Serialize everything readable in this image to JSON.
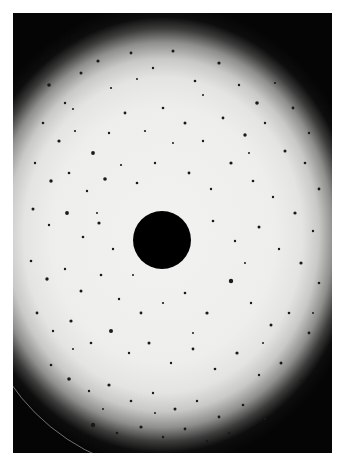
{
  "image": {
    "description": "Circular bright field of view with dark vignetted edges, scattered dark speckles, and an opaque dark disk at the center",
    "colors": {
      "background": "#ffffff",
      "field_center": "#f0f0ee",
      "vignette": "#050505",
      "speckle": "#1a1a1a",
      "center_disk": "#000000"
    },
    "center_disk": {
      "cx": 149,
      "cy": 227,
      "r": 29
    },
    "speckles": [
      [
        36,
        72,
        1.8
      ],
      [
        52,
        90,
        1.2
      ],
      [
        68,
        60,
        1.5
      ],
      [
        85,
        48,
        1.6
      ],
      [
        98,
        75,
        1.1
      ],
      [
        118,
        40,
        1.4
      ],
      [
        140,
        55,
        1.2
      ],
      [
        160,
        38,
        1.5
      ],
      [
        182,
        68,
        1.3
      ],
      [
        206,
        50,
        1.6
      ],
      [
        226,
        72,
        1.2
      ],
      [
        244,
        90,
        1.8
      ],
      [
        262,
        70,
        1.1
      ],
      [
        280,
        95,
        1.4
      ],
      [
        296,
        120,
        1.2
      ],
      [
        30,
        110,
        1.3
      ],
      [
        46,
        128,
        1.6
      ],
      [
        62,
        118,
        1.1
      ],
      [
        80,
        140,
        1.9
      ],
      [
        96,
        120,
        1.2
      ],
      [
        112,
        100,
        1.4
      ],
      [
        132,
        118,
        1.1
      ],
      [
        150,
        95,
        1.3
      ],
      [
        172,
        110,
        1.5
      ],
      [
        190,
        128,
        1.2
      ],
      [
        210,
        105,
        1.4
      ],
      [
        232,
        122,
        1.7
      ],
      [
        252,
        110,
        1.2
      ],
      [
        272,
        138,
        1.5
      ],
      [
        292,
        150,
        1.3
      ],
      [
        306,
        176,
        1.4
      ],
      [
        22,
        150,
        1.2
      ],
      [
        38,
        168,
        1.7
      ],
      [
        56,
        160,
        1.3
      ],
      [
        74,
        178,
        1.2
      ],
      [
        92,
        166,
        1.8
      ],
      [
        108,
        152,
        1.1
      ],
      [
        124,
        170,
        1.3
      ],
      [
        142,
        150,
        1.2
      ],
      [
        176,
        160,
        1.4
      ],
      [
        198,
        176,
        1.2
      ],
      [
        218,
        150,
        1.6
      ],
      [
        240,
        168,
        1.3
      ],
      [
        260,
        184,
        1.2
      ],
      [
        282,
        200,
        1.6
      ],
      [
        300,
        218,
        1.2
      ],
      [
        20,
        196,
        1.5
      ],
      [
        36,
        212,
        1.2
      ],
      [
        54,
        200,
        1.9
      ],
      [
        70,
        224,
        1.3
      ],
      [
        86,
        210,
        1.6
      ],
      [
        100,
        236,
        1.2
      ],
      [
        200,
        208,
        1.3
      ],
      [
        222,
        228,
        1.2
      ],
      [
        246,
        214,
        1.5
      ],
      [
        266,
        236,
        1.2
      ],
      [
        288,
        250,
        1.6
      ],
      [
        306,
        270,
        1.3
      ],
      [
        18,
        248,
        1.3
      ],
      [
        34,
        266,
        1.7
      ],
      [
        52,
        256,
        1.2
      ],
      [
        68,
        278,
        1.5
      ],
      [
        88,
        262,
        1.3
      ],
      [
        106,
        286,
        1.2
      ],
      [
        128,
        300,
        1.4
      ],
      [
        150,
        290,
        1.1
      ],
      [
        172,
        280,
        1.3
      ],
      [
        194,
        300,
        1.6
      ],
      [
        218,
        268,
        2.2
      ],
      [
        238,
        290,
        1.2
      ],
      [
        258,
        312,
        1.5
      ],
      [
        276,
        300,
        1.3
      ],
      [
        296,
        320,
        1.4
      ],
      [
        24,
        300,
        1.4
      ],
      [
        40,
        318,
        1.2
      ],
      [
        58,
        308,
        1.6
      ],
      [
        78,
        330,
        1.3
      ],
      [
        98,
        318,
        2.0
      ],
      [
        116,
        340,
        1.2
      ],
      [
        136,
        330,
        1.5
      ],
      [
        158,
        350,
        1.2
      ],
      [
        180,
        336,
        1.4
      ],
      [
        202,
        356,
        1.3
      ],
      [
        224,
        340,
        1.6
      ],
      [
        246,
        362,
        1.2
      ],
      [
        268,
        350,
        1.5
      ],
      [
        288,
        368,
        1.2
      ],
      [
        38,
        352,
        1.3
      ],
      [
        56,
        366,
        1.8
      ],
      [
        76,
        378,
        1.2
      ],
      [
        96,
        372,
        1.6
      ],
      [
        118,
        388,
        1.3
      ],
      [
        140,
        380,
        1.2
      ],
      [
        162,
        396,
        1.5
      ],
      [
        184,
        388,
        1.2
      ],
      [
        206,
        404,
        1.4
      ],
      [
        230,
        392,
        1.3
      ],
      [
        252,
        406,
        1.2
      ],
      [
        270,
        388,
        1.5
      ],
      [
        80,
        412,
        2.2
      ],
      [
        104,
        420,
        1.3
      ],
      [
        128,
        414,
        1.6
      ],
      [
        150,
        424,
        1.2
      ],
      [
        172,
        416,
        1.4
      ],
      [
        194,
        428,
        1.2
      ],
      [
        216,
        420,
        1.3
      ],
      [
        60,
        96,
        1.0
      ],
      [
        190,
        82,
        1.0
      ],
      [
        124,
        66,
        1.0
      ],
      [
        236,
        140,
        1.0
      ],
      [
        160,
        130,
        1.0
      ],
      [
        84,
        200,
        1.0
      ],
      [
        232,
        250,
        1.0
      ],
      [
        120,
        262,
        1.0
      ],
      [
        180,
        320,
        1.0
      ],
      [
        60,
        336,
        1.0
      ],
      [
        250,
        330,
        1.0
      ],
      [
        300,
        300,
        1.0
      ],
      [
        142,
        400,
        1.0
      ],
      [
        90,
        396,
        1.0
      ]
    ],
    "aperture_arcs": [
      {
        "left": -40,
        "top": 40,
        "width": 420,
        "height": 420,
        "border_color": "rgba(200,200,200,0.55)"
      }
    ]
  }
}
